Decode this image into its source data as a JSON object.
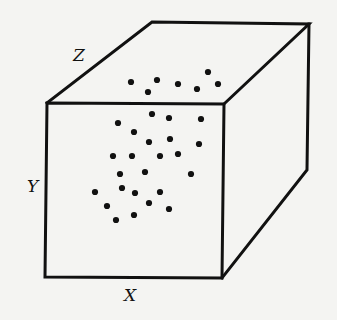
{
  "diagram": {
    "title": "",
    "type": "3d-box-scatter",
    "axis_labels": {
      "x": "X",
      "y": "Y",
      "z": "Z"
    },
    "colors": {
      "line": "#111111",
      "dot": "#111111",
      "background": "#f4f4f2"
    },
    "box": {
      "front_face": [
        [
          47,
          103
        ],
        [
          224,
          104
        ],
        [
          222,
          278
        ],
        [
          45,
          277
        ]
      ],
      "top_back_edge": [
        [
          152,
          22
        ],
        [
          309,
          24
        ]
      ],
      "right_back_edge": [
        [
          309,
          24
        ],
        [
          307,
          170
        ]
      ],
      "right_bottom_edge": [
        [
          307,
          170
        ],
        [
          222,
          278
        ]
      ]
    },
    "points": [
      [
        131,
        82
      ],
      [
        157,
        80
      ],
      [
        148,
        92
      ],
      [
        178,
        84
      ],
      [
        197,
        89
      ],
      [
        208,
        72
      ],
      [
        218,
        84
      ],
      [
        118,
        123
      ],
      [
        152,
        114
      ],
      [
        169,
        118
      ],
      [
        201,
        119
      ],
      [
        134,
        132
      ],
      [
        149,
        142
      ],
      [
        170,
        139
      ],
      [
        199,
        144
      ],
      [
        113,
        156
      ],
      [
        132,
        156
      ],
      [
        160,
        156
      ],
      [
        178,
        154
      ],
      [
        120,
        174
      ],
      [
        145,
        172
      ],
      [
        191,
        174
      ],
      [
        160,
        192
      ],
      [
        135,
        193
      ],
      [
        122,
        188
      ],
      [
        95,
        192
      ],
      [
        107,
        206
      ],
      [
        149,
        203
      ],
      [
        169,
        209
      ],
      [
        134,
        215
      ],
      [
        116,
        220
      ]
    ],
    "point_count": 31
  }
}
